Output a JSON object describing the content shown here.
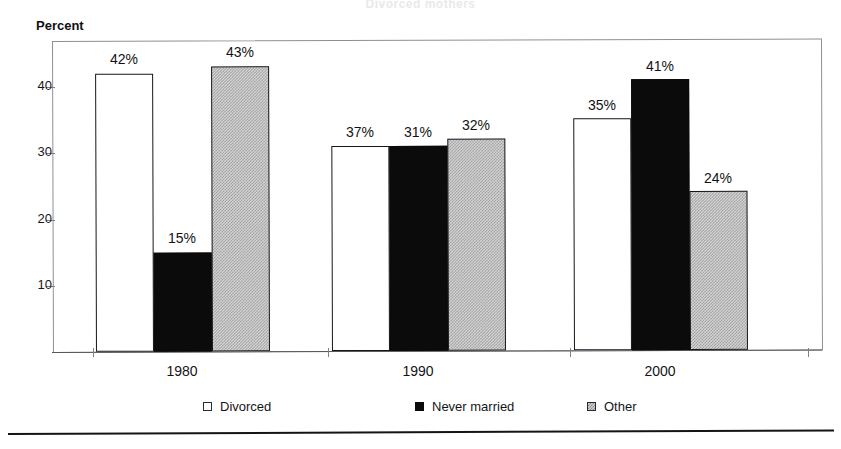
{
  "figure": {
    "cropped_title": "Divorced mothers  ",
    "axis_title": "Percent",
    "footer_rule": "horizontal-rule"
  },
  "chart_data": {
    "type": "bar",
    "title": "",
    "xlabel": "",
    "ylabel": "Percent",
    "categories": [
      "1980",
      "1990",
      "2000"
    ],
    "ylim": [
      0,
      47
    ],
    "yticks": [
      10,
      20,
      30,
      40
    ],
    "ytick_labels": [
      "10",
      "20",
      "30",
      "40"
    ],
    "grid": false,
    "legend_position": "bottom",
    "value_label_suffix": "%",
    "series": [
      {
        "name": "Divorced",
        "values": [
          42,
          31,
          35
        ],
        "labels": [
          "42%",
          "37%",
          "35%"
        ],
        "fill": "white",
        "color": "#ffffff"
      },
      {
        "name": "Never married",
        "values": [
          15,
          31,
          41
        ],
        "labels": [
          "15%",
          "31%",
          "41%"
        ],
        "fill": "solid-black",
        "color": "#0b0b0c"
      },
      {
        "name": "Other",
        "values": [
          43,
          32,
          24
        ],
        "labels": [
          "43%",
          "32%",
          "24%"
        ],
        "fill": "gray-dither",
        "color": "#b0b0b0"
      }
    ]
  },
  "legend": {
    "items": [
      {
        "label": "Divorced",
        "swatch": "divorced"
      },
      {
        "label": "Never married",
        "swatch": "never"
      },
      {
        "label": "Other",
        "swatch": "other"
      }
    ]
  }
}
